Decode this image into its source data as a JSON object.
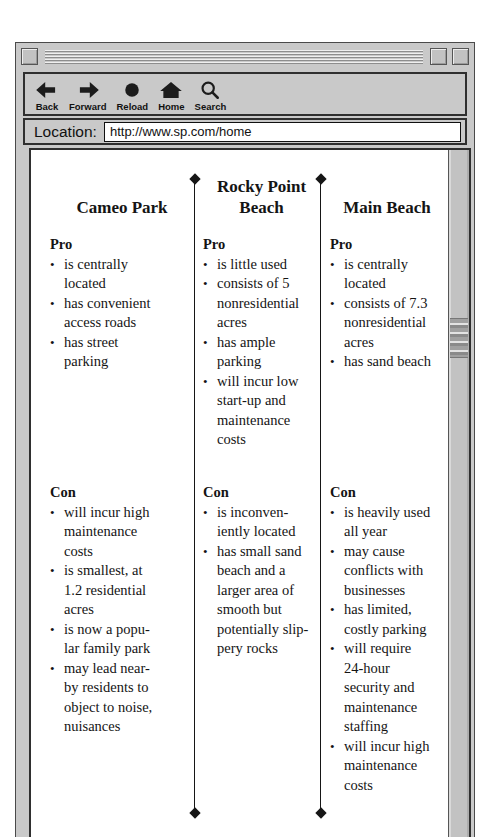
{
  "colors": {
    "chrome_gray": "#c9c9c9",
    "frame_border": "#2f2f2f",
    "content_bg": "#ffffff",
    "text": "#141414"
  },
  "toolbar": {
    "buttons": [
      {
        "label": "Back",
        "icon": "back-arrow-icon"
      },
      {
        "label": "Forward",
        "icon": "forward-arrow-icon"
      },
      {
        "label": "Reload",
        "icon": "reload-icon"
      },
      {
        "label": "Home",
        "icon": "home-icon"
      },
      {
        "label": "Search",
        "icon": "search-icon"
      }
    ]
  },
  "location_bar": {
    "label": "Location:",
    "url": "http://www.sp.com/home"
  },
  "comparison": {
    "bullet_char": "•",
    "columns": [
      {
        "title": "Cameo Park",
        "pro": {
          "heading": "Pro",
          "items": [
            "is centrally\nlocated",
            "has convenient\naccess roads",
            "has street\nparking"
          ]
        },
        "con": {
          "heading": "Con",
          "items": [
            "will incur high\nmaintenance\ncosts",
            "is smallest, at\n1.2 residential\nacres",
            "is now a popu-\nlar family park",
            "may lead near-\nby residents to\nobject to noise,\nnuisances"
          ]
        }
      },
      {
        "title": "Rocky Point\nBeach",
        "pro": {
          "heading": "Pro",
          "items": [
            "is little used",
            "consists of 5\nnonresidential\nacres",
            "has ample\nparking",
            "will incur low\nstart-up and\nmaintenance\ncosts"
          ]
        },
        "con": {
          "heading": "Con",
          "items": [
            "is inconven-\niently located",
            "has small sand\nbeach and a\nlarger area of\nsmooth but\npotentially slip-\npery rocks"
          ]
        }
      },
      {
        "title": "Main Beach",
        "pro": {
          "heading": "Pro",
          "items": [
            "is centrally\nlocated",
            "consists of 7.3\nnonresidential\nacres",
            "has sand beach"
          ]
        },
        "con": {
          "heading": "Con",
          "items": [
            "is heavily used\nall year",
            "may cause\nconflicts with\nbusinesses",
            "has limited,\ncostly parking",
            "will require\n24-hour\nsecurity and\nmaintenance\nstaffing",
            "will incur high\nmaintenance\ncosts"
          ]
        }
      }
    ]
  }
}
